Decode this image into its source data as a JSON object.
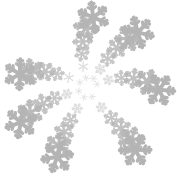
{
  "canvas": {
    "width": 177,
    "height": 177,
    "background_color": "#ffffff",
    "title": "",
    "description": "spiral-snowflake-pattern"
  },
  "pattern": {
    "name": "snowflake-spiral",
    "glyph": "six-pointed-snowflake",
    "arrangement": "logarithmic-spiral-arms",
    "arm_count": 7,
    "flakes_per_arm": 6,
    "total_flakes": 42,
    "center_x": 88,
    "center_y": 89,
    "inner_radius": 11,
    "outer_radius": 74,
    "size_min": 3.2,
    "size_max": 15.5,
    "rotation_per_step_deg": 13,
    "arm_twist_deg": 26,
    "color": "#b4b4b4",
    "color_light": "#cfcfcf",
    "color_dark": "#9a9a9a",
    "stroke_width_ratio": 0.26
  },
  "chart_data": {
    "type": "scatter",
    "title": "",
    "xlabel": "",
    "ylabel": "",
    "xlim": [
      0,
      177
    ],
    "ylim": [
      0,
      177
    ],
    "grid": false,
    "legend": null,
    "marker": "six-pointed-snowflake",
    "color": "#b4b4b4",
    "points": [
      {
        "arm": 0,
        "step": 0,
        "x": 97.0,
        "y": 84.2,
        "r": 11.0,
        "size": 3.2,
        "angle": -24.0,
        "rot": 0
      },
      {
        "arm": 0,
        "step": 1,
        "x": 108.4,
        "y": 80.0,
        "r": 22.0,
        "size": 5.1,
        "angle": -22.0,
        "rot": 13
      },
      {
        "arm": 0,
        "step": 2,
        "x": 121.3,
        "y": 77.9,
        "r": 33.5,
        "size": 7.2,
        "angle": -18.5,
        "rot": 26
      },
      {
        "arm": 0,
        "step": 3,
        "x": 133.6,
        "y": 78.4,
        "r": 45.6,
        "size": 9.5,
        "angle": -13.0,
        "rot": 39
      },
      {
        "arm": 0,
        "step": 4,
        "x": 147.4,
        "y": 82.0,
        "r": 59.5,
        "size": 12.3,
        "angle": -6.8,
        "rot": 52
      },
      {
        "arm": 0,
        "step": 5,
        "x": 159.2,
        "y": 89.8,
        "r": 71.2,
        "size": 15.2,
        "angle": 0.6,
        "rot": 65
      },
      {
        "arm": 1,
        "step": 0,
        "x": 93.6,
        "y": 78.5,
        "r": 11.4,
        "size": 3.3,
        "angle": -67.5,
        "rot": 9
      },
      {
        "arm": 1,
        "step": 1,
        "x": 100.2,
        "y": 69.2,
        "r": 22.7,
        "size": 5.2,
        "angle": -62.0,
        "rot": 22
      },
      {
        "arm": 1,
        "step": 2,
        "x": 107.6,
        "y": 58.6,
        "r": 34.8,
        "size": 7.4,
        "angle": -56.5,
        "rot": 35
      },
      {
        "arm": 1,
        "step": 3,
        "x": 116.9,
        "y": 48.2,
        "r": 47.2,
        "size": 9.7,
        "angle": -50.2,
        "rot": 48
      },
      {
        "arm": 1,
        "step": 4,
        "x": 127.8,
        "y": 38.6,
        "r": 61.0,
        "size": 12.5,
        "angle": -43.5,
        "rot": 61
      },
      {
        "arm": 1,
        "step": 5,
        "x": 137.9,
        "y": 32.4,
        "r": 72.0,
        "size": 15.4,
        "angle": -37.2,
        "rot": 74
      },
      {
        "arm": 2,
        "step": 0,
        "x": 86.0,
        "y": 77.8,
        "r": 11.4,
        "size": 3.2,
        "angle": -104.0,
        "rot": 18
      },
      {
        "arm": 2,
        "step": 1,
        "x": 83.1,
        "y": 66.6,
        "r": 22.8,
        "size": 5.0,
        "angle": -100.0,
        "rot": 31
      },
      {
        "arm": 2,
        "step": 2,
        "x": 81.9,
        "y": 54.0,
        "r": 35.3,
        "size": 7.1,
        "angle": -95.0,
        "rot": 44
      },
      {
        "arm": 2,
        "step": 3,
        "x": 82.6,
        "y": 41.4,
        "r": 47.8,
        "size": 9.4,
        "angle": -89.5,
        "rot": 57
      },
      {
        "arm": 2,
        "step": 4,
        "x": 86.4,
        "y": 27.6,
        "r": 61.5,
        "size": 12.2,
        "angle": -83.0,
        "rot": 70
      },
      {
        "arm": 2,
        "step": 5,
        "x": 93.2,
        "y": 17.4,
        "r": 72.5,
        "size": 15.1,
        "angle": -76.5,
        "rot": 83
      },
      {
        "arm": 3,
        "step": 0,
        "x": 79.9,
        "y": 82.5,
        "r": 10.1,
        "size": 3.1,
        "angle": -147.0,
        "rot": 27
      },
      {
        "arm": 3,
        "step": 1,
        "x": 68.9,
        "y": 77.4,
        "r": 22.3,
        "size": 5.0,
        "angle": -141.5,
        "rot": 40
      },
      {
        "arm": 3,
        "step": 2,
        "x": 57.1,
        "y": 73.8,
        "r": 34.3,
        "size": 7.0,
        "angle": -136.0,
        "rot": 53
      },
      {
        "arm": 3,
        "step": 3,
        "x": 45.2,
        "y": 71.6,
        "r": 46.5,
        "size": 9.3,
        "angle": -130.4,
        "rot": 66
      },
      {
        "arm": 3,
        "step": 4,
        "x": 31.4,
        "y": 71.5,
        "r": 60.4,
        "size": 12.1,
        "angle": -124.0,
        "rot": 79
      },
      {
        "arm": 3,
        "step": 5,
        "x": 19.8,
        "y": 74.2,
        "r": 71.8,
        "size": 15.0,
        "angle": -118.0,
        "rot": 92
      },
      {
        "arm": 4,
        "step": 0,
        "x": 78.8,
        "y": 91.1,
        "r": 9.4,
        "size": 3.2,
        "angle": 167.0,
        "rot": 36
      },
      {
        "arm": 4,
        "step": 1,
        "x": 66.9,
        "y": 94.0,
        "r": 21.6,
        "size": 5.1,
        "angle": 173.0,
        "rot": 49
      },
      {
        "arm": 4,
        "step": 2,
        "x": 54.6,
        "y": 98.1,
        "r": 34.3,
        "size": 7.2,
        "angle": 178.5,
        "rot": 62
      },
      {
        "arm": 4,
        "step": 3,
        "x": 43.0,
        "y": 103.9,
        "r": 46.7,
        "size": 9.5,
        "angle": 175.0,
        "rot": 75
      },
      {
        "arm": 4,
        "step": 4,
        "x": 30.1,
        "y": 112.8,
        "r": 60.7,
        "size": 12.3,
        "angle": 170.0,
        "rot": 88
      },
      {
        "arm": 4,
        "step": 5,
        "x": 20.8,
        "y": 122.4,
        "r": 72.2,
        "size": 15.2,
        "angle": 164.5,
        "rot": 101
      },
      {
        "arm": 5,
        "step": 0,
        "x": 84.2,
        "y": 97.4,
        "r": 9.3,
        "size": 3.2,
        "angle": 124.0,
        "rot": 45
      },
      {
        "arm": 5,
        "step": 1,
        "x": 77.3,
        "y": 108.6,
        "r": 22.8,
        "size": 5.2,
        "angle": 128.0,
        "rot": 58
      },
      {
        "arm": 5,
        "step": 2,
        "x": 70.6,
        "y": 120.2,
        "r": 35.2,
        "size": 7.3,
        "angle": 132.5,
        "rot": 71
      },
      {
        "arm": 5,
        "step": 3,
        "x": 64.0,
        "y": 131.9,
        "r": 48.0,
        "size": 9.6,
        "angle": 137.0,
        "rot": 84
      },
      {
        "arm": 5,
        "step": 4,
        "x": 58.6,
        "y": 145.6,
        "r": 61.8,
        "size": 12.4,
        "angle": 142.5,
        "rot": 97
      },
      {
        "arm": 5,
        "step": 5,
        "x": 57.2,
        "y": 156.8,
        "r": 72.6,
        "size": 15.3,
        "angle": 148.0,
        "rot": 110
      },
      {
        "arm": 6,
        "step": 0,
        "x": 92.2,
        "y": 96.8,
        "r": 9.0,
        "size": 3.3,
        "angle": 70.0,
        "rot": 54
      },
      {
        "arm": 6,
        "step": 1,
        "x": 101.4,
        "y": 107.4,
        "r": 22.2,
        "size": 5.2,
        "angle": 74.0,
        "rot": 67
      },
      {
        "arm": 6,
        "step": 2,
        "x": 111.4,
        "y": 118.1,
        "r": 35.4,
        "size": 7.4,
        "angle": 79.0,
        "rot": 80
      },
      {
        "arm": 6,
        "step": 3,
        "x": 121.0,
        "y": 128.3,
        "r": 48.4,
        "size": 9.7,
        "angle": 84.0,
        "rot": 93
      },
      {
        "arm": 6,
        "step": 4,
        "x": 131.6,
        "y": 140.1,
        "r": 62.5,
        "size": 12.5,
        "angle": 89.5,
        "rot": 106
      },
      {
        "arm": 6,
        "step": 5,
        "x": 135.2,
        "y": 150.0,
        "r": 72.8,
        "size": 15.4,
        "angle": 95.0,
        "rot": 119
      }
    ]
  }
}
